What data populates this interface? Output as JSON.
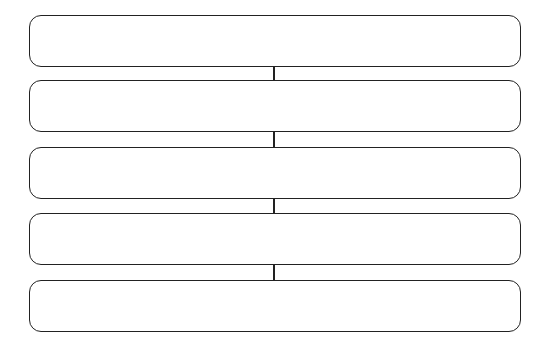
{
  "diagram": {
    "type": "vertical-flowchart",
    "stroke_color": "#222222",
    "background_color": "#ffffff",
    "boxes": [
      {
        "index": 1,
        "label": ""
      },
      {
        "index": 2,
        "label": ""
      },
      {
        "index": 3,
        "label": ""
      },
      {
        "index": 4,
        "label": ""
      },
      {
        "index": 5,
        "label": ""
      }
    ],
    "connectors": [
      {
        "from": 1,
        "to": 2
      },
      {
        "from": 2,
        "to": 3
      },
      {
        "from": 3,
        "to": 4
      },
      {
        "from": 4,
        "to": 5
      }
    ]
  }
}
